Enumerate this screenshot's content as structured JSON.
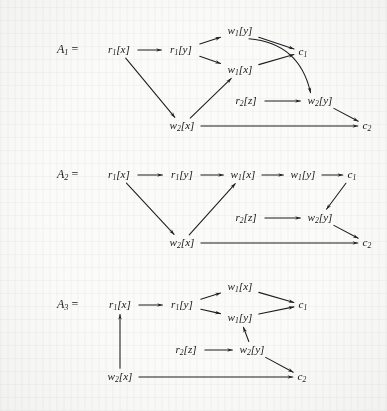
{
  "figure": {
    "background_color": "#fbfbfa",
    "ink_color": "#1d1d20",
    "width": 387,
    "height": 411
  },
  "graphs": [
    {
      "id": "A1",
      "label_base": "A",
      "label_sub": "1",
      "equals": "=",
      "nodes": [
        {
          "key": "r1x",
          "base": "r",
          "sub": "1",
          "arg": "[x]",
          "x": 119,
          "y": 50
        },
        {
          "key": "r1y",
          "base": "r",
          "sub": "1",
          "arg": "[y]",
          "x": 181,
          "y": 50
        },
        {
          "key": "w1y",
          "base": "w",
          "sub": "1",
          "arg": "[y]",
          "x": 240,
          "y": 31
        },
        {
          "key": "w1x",
          "base": "w",
          "sub": "1",
          "arg": "[x]",
          "x": 240,
          "y": 70
        },
        {
          "key": "c1",
          "base": "c",
          "sub": "1",
          "arg": "",
          "x": 303,
          "y": 52
        },
        {
          "key": "r2z",
          "base": "r",
          "sub": "2",
          "arg": "[z]",
          "x": 246,
          "y": 101
        },
        {
          "key": "w2y",
          "base": "w",
          "sub": "2",
          "arg": "[y]",
          "x": 320,
          "y": 101
        },
        {
          "key": "w2x",
          "base": "w",
          "sub": "2",
          "arg": "[x]",
          "x": 182,
          "y": 126
        },
        {
          "key": "c2",
          "base": "c",
          "sub": "2",
          "arg": "",
          "x": 367,
          "y": 126
        }
      ],
      "edges": [
        {
          "from": "r1x",
          "to": "r1y",
          "style": "straight"
        },
        {
          "from": "r1x",
          "to": "w2x",
          "style": "straight"
        },
        {
          "from": "r1y",
          "to": "w1y",
          "style": "straight"
        },
        {
          "from": "r1y",
          "to": "w1x",
          "style": "straight"
        },
        {
          "from": "w2x",
          "to": "w1x",
          "style": "straight"
        },
        {
          "from": "w1y",
          "to": "c1",
          "style": "straight"
        },
        {
          "from": "w1x",
          "to": "c1",
          "style": "straight"
        },
        {
          "from": "w1y",
          "to": "w2y",
          "style": "curved"
        },
        {
          "from": "r2z",
          "to": "w2y",
          "style": "straight"
        },
        {
          "from": "w2y",
          "to": "c2",
          "style": "straight"
        },
        {
          "from": "w2x",
          "to": "c2",
          "style": "straight"
        }
      ]
    },
    {
      "id": "A2",
      "label_base": "A",
      "label_sub": "2",
      "equals": "=",
      "nodes": [
        {
          "key": "r1x",
          "base": "r",
          "sub": "1",
          "arg": "[x]",
          "x": 119,
          "y": 175
        },
        {
          "key": "r1y",
          "base": "r",
          "sub": "1",
          "arg": "[y]",
          "x": 182,
          "y": 175
        },
        {
          "key": "w1x",
          "base": "w",
          "sub": "1",
          "arg": "[x]",
          "x": 243,
          "y": 175
        },
        {
          "key": "w1y",
          "base": "w",
          "sub": "1",
          "arg": "[y]",
          "x": 303,
          "y": 175
        },
        {
          "key": "c1",
          "base": "c",
          "sub": "1",
          "arg": "",
          "x": 352,
          "y": 175
        },
        {
          "key": "r2z",
          "base": "r",
          "sub": "2",
          "arg": "[z]",
          "x": 246,
          "y": 218
        },
        {
          "key": "w2y",
          "base": "w",
          "sub": "2",
          "arg": "[y]",
          "x": 320,
          "y": 218
        },
        {
          "key": "w2x",
          "base": "w",
          "sub": "2",
          "arg": "[x]",
          "x": 182,
          "y": 243
        },
        {
          "key": "c2",
          "base": "c",
          "sub": "2",
          "arg": "",
          "x": 367,
          "y": 243
        }
      ],
      "edges": [
        {
          "from": "r1x",
          "to": "r1y",
          "style": "straight"
        },
        {
          "from": "r1y",
          "to": "w1x",
          "style": "straight"
        },
        {
          "from": "w1x",
          "to": "w1y",
          "style": "straight"
        },
        {
          "from": "w1y",
          "to": "c1",
          "style": "straight"
        },
        {
          "from": "r1x",
          "to": "w2x",
          "style": "straight"
        },
        {
          "from": "w2x",
          "to": "w1x",
          "style": "straight"
        },
        {
          "from": "c1",
          "to": "w2y",
          "style": "straight"
        },
        {
          "from": "r2z",
          "to": "w2y",
          "style": "straight"
        },
        {
          "from": "w2y",
          "to": "c2",
          "style": "straight"
        },
        {
          "from": "w2x",
          "to": "c2",
          "style": "straight"
        }
      ]
    },
    {
      "id": "A3",
      "label_base": "A",
      "label_sub": "3",
      "equals": "=",
      "nodes": [
        {
          "key": "r1x",
          "base": "r",
          "sub": "1",
          "arg": "[x]",
          "x": 120,
          "y": 305
        },
        {
          "key": "r1y",
          "base": "r",
          "sub": "1",
          "arg": "[y]",
          "x": 182,
          "y": 305
        },
        {
          "key": "w1x",
          "base": "w",
          "sub": "1",
          "arg": "[x]",
          "x": 240,
          "y": 287
        },
        {
          "key": "w1y",
          "base": "w",
          "sub": "1",
          "arg": "[y]",
          "x": 240,
          "y": 318
        },
        {
          "key": "c1",
          "base": "c",
          "sub": "1",
          "arg": "",
          "x": 303,
          "y": 305
        },
        {
          "key": "r2z",
          "base": "r",
          "sub": "2",
          "arg": "[z]",
          "x": 186,
          "y": 350
        },
        {
          "key": "w2y",
          "base": "w",
          "sub": "2",
          "arg": "[y]",
          "x": 252,
          "y": 350
        },
        {
          "key": "w2x",
          "base": "w",
          "sub": "2",
          "arg": "[x]",
          "x": 120,
          "y": 377
        },
        {
          "key": "c2",
          "base": "c",
          "sub": "2",
          "arg": "",
          "x": 302,
          "y": 377
        }
      ],
      "edges": [
        {
          "from": "r1x",
          "to": "r1y",
          "style": "straight"
        },
        {
          "from": "r1y",
          "to": "w1x",
          "style": "straight"
        },
        {
          "from": "r1y",
          "to": "w1y",
          "style": "straight"
        },
        {
          "from": "w1x",
          "to": "c1",
          "style": "straight"
        },
        {
          "from": "w1y",
          "to": "c1",
          "style": "straight"
        },
        {
          "from": "w2x",
          "to": "r1x",
          "style": "straight"
        },
        {
          "from": "r2z",
          "to": "w2y",
          "style": "straight"
        },
        {
          "from": "w2y",
          "to": "w1y",
          "style": "straight"
        },
        {
          "from": "w2y",
          "to": "c2",
          "style": "straight"
        },
        {
          "from": "w2x",
          "to": "c2",
          "style": "straight"
        }
      ]
    }
  ],
  "group_labels": [
    {
      "id": "A1",
      "x": 57,
      "y": 50
    },
    {
      "id": "A2",
      "x": 57,
      "y": 175
    },
    {
      "id": "A3",
      "x": 57,
      "y": 305
    }
  ]
}
